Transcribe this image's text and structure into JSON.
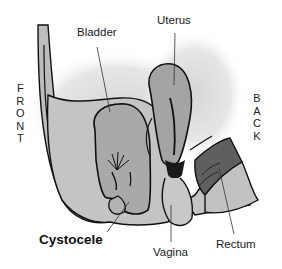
{
  "figure": {
    "type": "anatomical-sagittal-diagram"
  },
  "orientation": {
    "front_letters": [
      "F",
      "R",
      "O",
      "N",
      "T"
    ],
    "back_letters": [
      "B",
      "A",
      "C",
      "K"
    ]
  },
  "labels": {
    "bladder": "Bladder",
    "uterus": "Uterus",
    "cystocele": "Cystocele",
    "vagina": "Vagina",
    "rectum": "Rectum"
  },
  "colors": {
    "tissue_light": "#c9c9c9",
    "organ_mid": "#a8a8a8",
    "rectum_dark": "#5e5e5e",
    "outline": "#111111",
    "shadow_halo": "#e2e2e2"
  }
}
